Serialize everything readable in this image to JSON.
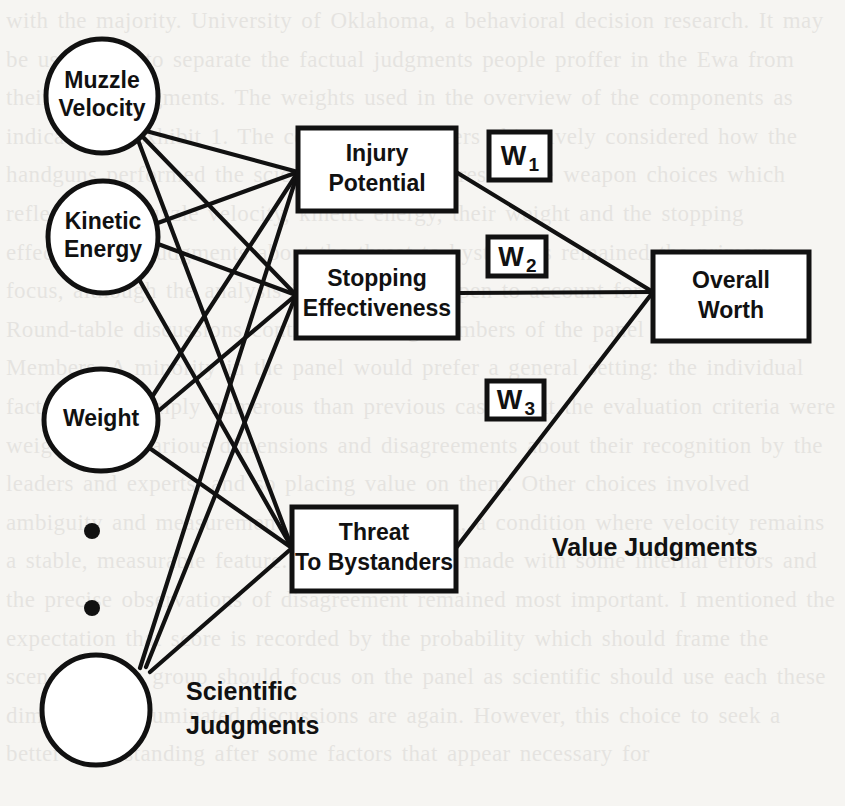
{
  "figure": {
    "kind": "value-tree-diagram",
    "background_color": "#f6f5f2",
    "ink_color": "#111111",
    "attribute_nodes": [
      {
        "id": "muzzle-velocity",
        "label_line1": "Muzzle",
        "label_line2": "Velocity",
        "shape": "ellipse",
        "cx": 102,
        "cy": 96,
        "rx": 56,
        "ry": 57
      },
      {
        "id": "kinetic-energy",
        "label_line1": "Kinetic",
        "label_line2": "Energy",
        "shape": "ellipse",
        "cx": 103,
        "cy": 237,
        "rx": 55,
        "ry": 56
      },
      {
        "id": "weight",
        "label_line1": "Weight",
        "label_line2": "",
        "shape": "ellipse",
        "cx": 101,
        "cy": 420,
        "rx": 57,
        "ry": 51
      },
      {
        "id": "unlabeled-attribute",
        "label_line1": "",
        "label_line2": "",
        "shape": "ellipse",
        "cx": 96,
        "cy": 710,
        "rx": 54,
        "ry": 55
      }
    ],
    "ellipsis_dots": [
      {
        "cx": 92,
        "cy": 531,
        "r": 8
      },
      {
        "cx": 92,
        "cy": 608,
        "r": 8
      }
    ],
    "objective_boxes": [
      {
        "id": "injury-potential",
        "label_line1": "Injury",
        "label_line2": "Potential",
        "x": 298,
        "y": 128,
        "w": 158,
        "h": 83
      },
      {
        "id": "stopping-effectiveness",
        "label_line1": "Stopping",
        "label_line2": "Effectiveness",
        "x": 296,
        "y": 252,
        "w": 162,
        "h": 86
      },
      {
        "id": "threat-to-bystanders",
        "label_line1": "Threat",
        "label_line2": "To Bystanders",
        "x": 292,
        "y": 507,
        "w": 164,
        "h": 84
      }
    ],
    "overall_box": {
      "id": "overall-worth",
      "label_line1": "Overall",
      "label_line2": "Worth",
      "x": 653,
      "y": 252,
      "w": 156,
      "h": 89
    },
    "weight_boxes": [
      {
        "id": "w1",
        "base": "W",
        "subscript": "1",
        "x": 489,
        "y": 132,
        "w": 61,
        "h": 48
      },
      {
        "id": "w2",
        "base": "W",
        "subscript": "2",
        "x": 488,
        "y": 237,
        "w": 58,
        "h": 39
      },
      {
        "id": "w3",
        "base": "W",
        "subscript": "3",
        "x": 487,
        "y": 381,
        "w": 57,
        "h": 38
      }
    ],
    "group_labels": [
      {
        "id": "value-judgments",
        "line1": "Value Judgments",
        "line2": "",
        "x": 552,
        "y": 556
      },
      {
        "id": "scientific-judgments",
        "line1": "Scientific",
        "line2": "Judgments",
        "x": 186,
        "y": 700
      }
    ],
    "edges": [
      {
        "id": "muzzle-velocity-to-injury-potential",
        "from": "muzzle-velocity",
        "to": "injury-potential",
        "x1": 146,
        "y1": 131,
        "x2": 298,
        "y2": 172
      },
      {
        "id": "muzzle-velocity-to-stopping-effectiveness",
        "from": "muzzle-velocity",
        "to": "stopping-effectiveness",
        "x1": 142,
        "y1": 136,
        "x2": 296,
        "y2": 295
      },
      {
        "id": "muzzle-velocity-to-threat-to-bystanders",
        "from": "muzzle-velocity",
        "to": "threat-to-bystanders",
        "x1": 138,
        "y1": 140,
        "x2": 292,
        "y2": 548
      },
      {
        "id": "kinetic-energy-to-injury-potential",
        "from": "kinetic-energy",
        "to": "injury-potential",
        "x1": 155,
        "y1": 224,
        "x2": 298,
        "y2": 172
      },
      {
        "id": "kinetic-energy-to-stopping-effectiveness",
        "from": "kinetic-energy",
        "to": "stopping-effectiveness",
        "x1": 158,
        "y1": 244,
        "x2": 296,
        "y2": 295
      },
      {
        "id": "kinetic-energy-to-threat-to-bystanders",
        "from": "kinetic-energy",
        "to": "threat-to-bystanders",
        "x1": 140,
        "y1": 281,
        "x2": 292,
        "y2": 548
      },
      {
        "id": "weight-to-injury-potential",
        "from": "weight",
        "to": "injury-potential",
        "x1": 150,
        "y1": 400,
        "x2": 298,
        "y2": 172
      },
      {
        "id": "weight-to-stopping-effectiveness",
        "from": "weight",
        "to": "stopping-effectiveness",
        "x1": 156,
        "y1": 413,
        "x2": 296,
        "y2": 295
      },
      {
        "id": "weight-to-threat-to-bystanders",
        "from": "weight",
        "to": "threat-to-bystanders",
        "x1": 148,
        "y1": 447,
        "x2": 292,
        "y2": 548
      },
      {
        "id": "unlabeled-to-injury-potential",
        "from": "unlabeled-attribute",
        "to": "injury-potential",
        "x1": 140,
        "y1": 668,
        "x2": 298,
        "y2": 172
      },
      {
        "id": "unlabeled-to-stopping-effectiveness",
        "from": "unlabeled-attribute",
        "to": "stopping-effectiveness",
        "x1": 146,
        "y1": 667,
        "x2": 296,
        "y2": 295
      },
      {
        "id": "unlabeled-to-threat-to-bystanders",
        "from": "unlabeled-attribute",
        "to": "threat-to-bystanders",
        "x1": 150,
        "y1": 672,
        "x2": 292,
        "y2": 548
      },
      {
        "id": "injury-potential-to-overall-worth",
        "from": "injury-potential",
        "to": "overall-worth",
        "x1": 456,
        "y1": 172,
        "x2": 653,
        "y2": 292
      },
      {
        "id": "stopping-effectiveness-to-overall-worth",
        "from": "stopping-effectiveness",
        "to": "overall-worth",
        "x1": 458,
        "y1": 293,
        "x2": 653,
        "y2": 292
      },
      {
        "id": "threat-to-bystanders-to-overall-worth",
        "from": "threat-to-bystanders",
        "to": "overall-worth",
        "x1": 456,
        "y1": 548,
        "x2": 653,
        "y2": 292
      }
    ]
  },
  "page_bleed": {
    "visible_fragment": "with the majority. University of Oklahoma, a behavioral decision research. It may be useful not to separate the factual judgments people proffer in the Ewa from their value judgments. The weights used in the overview of the components as indicated in Exhibit 1. The committee members objectively considered how the handguns performed the scientific data to represent the weapon choices which reflect their muzzle velocity, kinetic energy, their weight and the stopping effectiveness. Judgments about the threat to bystanders remained the primary focus, although the analysis itself remained open to account for the conditions. Round-table discussions continued among members of the panel on whether Members. A minority in the panel would prefer a general setting: the individual factors were simply numerous than previous cases. But the evaluation criteria were weighted for various dimensions and disagreements about their recognition by the leaders and experts, and so placing value on them. Other choices involved ambiguity and measurement error formulation, a condition where velocity remains a stable, measurable feature. Judgments were made with some internal errors and the precise observations of disagreement remained most important. I mentioned the expectation that score is recorded by the probability which should frame the scenario. This group should focus on the panel as scientific should use each these dimensions. Illuminated discussions are again. However, this choice to seek a better understanding after some factors that appear necessary for"
  }
}
